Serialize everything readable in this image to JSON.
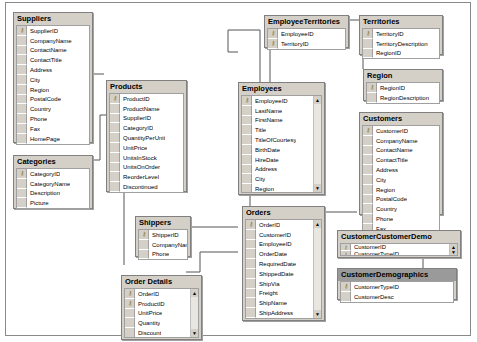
{
  "diagram": {
    "tables": {
      "suppliers": {
        "title": "Suppliers",
        "columns": [
          "SupplierID",
          "CompanyName",
          "ContactName",
          "ContactTitle",
          "Address",
          "City",
          "Region",
          "PostalCode",
          "Country",
          "Phone",
          "Fax",
          "HomePage"
        ],
        "keys": [
          0
        ]
      },
      "products": {
        "title": "Products",
        "columns": [
          "ProductID",
          "ProductName",
          "SupplierID",
          "CategoryID",
          "QuantityPerUnit",
          "UnitPrice",
          "UnitsInStock",
          "UnitsOnOrder",
          "ReorderLevel",
          "Discontinued"
        ],
        "keys": [
          0
        ]
      },
      "categories": {
        "title": "Categories",
        "columns": [
          "CategoryID",
          "CategoryName",
          "Description",
          "Picture"
        ],
        "keys": [
          0
        ]
      },
      "employee_territories": {
        "title": "EmployeeTerritories",
        "columns": [
          "EmployeeID",
          "TerritoryID"
        ],
        "keys": [
          0,
          1
        ]
      },
      "territories": {
        "title": "Territories",
        "columns": [
          "TerritoryID",
          "TerritoryDescription",
          "RegionID"
        ],
        "keys": [
          0
        ]
      },
      "region": {
        "title": "Region",
        "columns": [
          "RegionID",
          "RegionDescription"
        ],
        "keys": [
          0
        ]
      },
      "employees": {
        "title": "Employees",
        "columns": [
          "EmployeeID",
          "LastName",
          "FirstName",
          "Title",
          "TitleOfCourtesy",
          "BirthDate",
          "HireDate",
          "Address",
          "City",
          "Region",
          "PostalCode",
          "Country"
        ],
        "keys": [
          0
        ],
        "scrollable": true
      },
      "customers": {
        "title": "Customers",
        "columns": [
          "CustomerID",
          "CompanyName",
          "ContactName",
          "ContactTitle",
          "Address",
          "City",
          "Region",
          "PostalCode",
          "Country",
          "Phone",
          "Fax"
        ],
        "keys": [
          0
        ]
      },
      "shippers": {
        "title": "Shippers",
        "columns": [
          "ShipperID",
          "CompanyName",
          "Phone"
        ],
        "keys": [
          0
        ]
      },
      "orders": {
        "title": "Orders",
        "columns": [
          "OrderID",
          "CustomerID",
          "EmployeeID",
          "OrderDate",
          "RequiredDate",
          "ShippedDate",
          "ShipVia",
          "Freight",
          "ShipName",
          "ShipAddress",
          "ShipCity",
          "ShipRegion"
        ],
        "keys": [
          0
        ],
        "scrollable": true
      },
      "order_details": {
        "title": "Order Details",
        "columns": [
          "OrderID",
          "ProductID",
          "UnitPrice",
          "Quantity",
          "Discount"
        ],
        "keys": [
          0,
          1
        ],
        "scrollable": true
      },
      "customer_customer_demo": {
        "title": "CustomerCustomerDemo",
        "columns": [
          "CustomerID",
          "CustomerTypeID"
        ],
        "keys": [
          0,
          1
        ],
        "scrollable": true
      },
      "customer_demographics": {
        "title": "CustomerDemographics",
        "columns": [
          "CustomerTypeID",
          "CustomerDesc"
        ],
        "keys": [
          0
        ],
        "selected": true
      }
    },
    "icons": {
      "key": "⚷",
      "scroll_up": "▲",
      "scroll_down": "▼"
    }
  }
}
